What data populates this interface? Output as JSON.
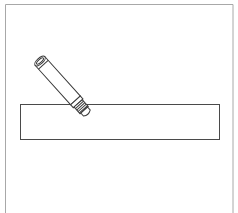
{
  "figure": {
    "kind": "line-drawing",
    "colors": {
      "background": "#ffffff",
      "frame": "#a8a8a8",
      "stroke": "#4a4a4a"
    },
    "frame": {
      "left": 5.5,
      "top": 4.5,
      "right": 233,
      "bottom_open": true
    },
    "plate": {
      "x": 20.5,
      "y": 104.5,
      "width": 199,
      "height": 35
    },
    "sensor": {
      "cap_center": [
        40,
        61
      ],
      "tip_center": [
        86,
        113
      ],
      "angle_deg": 48,
      "body_radius": 6
    }
  }
}
